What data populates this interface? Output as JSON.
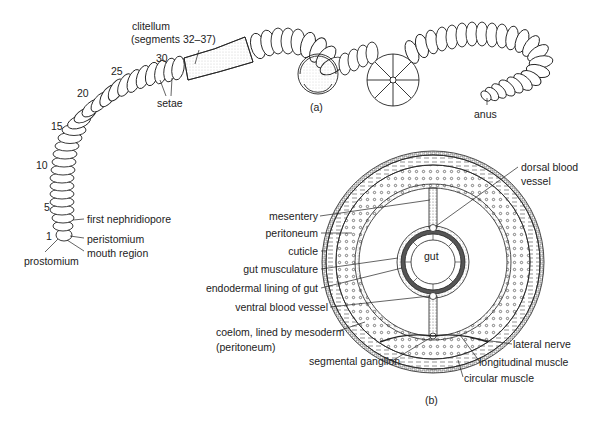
{
  "figure": {
    "panel_a_label": "(a)",
    "panel_b_label": "(b)"
  },
  "worm": {
    "clitellum": "clitellum",
    "clitellum_segments": "(segments 32–37)",
    "segment_numbers": [
      "30",
      "25",
      "20",
      "15",
      "10",
      "5",
      "1"
    ],
    "setae": "setae",
    "first_nephridiopore": "first nephridiopore",
    "peristomium": "peristomium",
    "mouth_region": "mouth region",
    "prostomium": "prostomium",
    "anus": "anus"
  },
  "cross_section": {
    "gut": "gut",
    "dorsal_blood_vessel_1": "dorsal blood",
    "dorsal_blood_vessel_2": "vessel",
    "mesentery": "mesentery",
    "peritoneum": "peritoneum",
    "cuticle": "cuticle",
    "gut_musculature": "gut musculature",
    "endodermal_lining": "endodermal lining of gut",
    "ventral_blood_vessel": "ventral blood vessel",
    "coelom_1": "coelom, lined by mesoderm",
    "coelom_2": "(peritoneum)",
    "segmental_ganglion": "segmental ganglion",
    "lateral_nerve": "lateral nerve",
    "longitudinal_muscle": "longitudinal muscle",
    "circular_muscle": "circular muscle"
  }
}
